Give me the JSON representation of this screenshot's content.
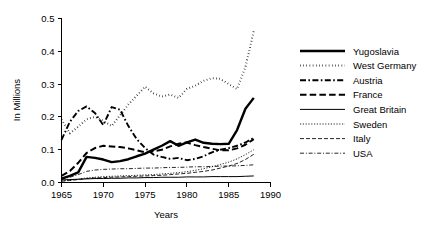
{
  "chart_data": {
    "type": "line",
    "title": "",
    "xlabel": "Years",
    "ylabel": "In Millions",
    "xlim": [
      1965,
      1990
    ],
    "ylim": [
      0.0,
      0.5
    ],
    "grid": false,
    "legend_position": "right",
    "xticks": [
      "1965",
      "1970",
      "1975",
      "1980",
      "1985",
      "1990"
    ],
    "xtick_values": [
      1965,
      1970,
      1975,
      1980,
      1985,
      1990
    ],
    "yticks": [
      "0.0",
      "0.1",
      "0.2",
      "0.3",
      "0.4",
      "0.5"
    ],
    "ytick_values": [
      0.0,
      0.1,
      0.2,
      0.3,
      0.4,
      0.5
    ],
    "x": [
      1965,
      1966,
      1967,
      1968,
      1969,
      1970,
      1971,
      1972,
      1973,
      1974,
      1975,
      1976,
      1977,
      1978,
      1979,
      1980,
      1981,
      1982,
      1983,
      1984,
      1985,
      1986,
      1987,
      1988
    ],
    "series": [
      {
        "name": "Yugoslavia",
        "style": "thick-solid",
        "values": [
          0.012,
          0.02,
          0.031,
          0.078,
          0.075,
          0.07,
          0.062,
          0.065,
          0.071,
          0.08,
          0.088,
          0.1,
          0.112,
          0.126,
          0.112,
          0.122,
          0.131,
          0.121,
          0.118,
          0.117,
          0.118,
          0.16,
          0.225,
          0.258
        ]
      },
      {
        "name": "West Germany",
        "style": "dotted",
        "values": [
          0.192,
          0.15,
          0.17,
          0.193,
          0.2,
          0.188,
          0.172,
          0.205,
          0.238,
          0.265,
          0.292,
          0.272,
          0.262,
          0.268,
          0.258,
          0.285,
          0.295,
          0.31,
          0.318,
          0.316,
          0.3,
          0.285,
          0.352,
          0.462
        ]
      },
      {
        "name": "Austria",
        "style": "dash-dot",
        "values": [
          0.13,
          0.185,
          0.218,
          0.232,
          0.212,
          0.175,
          0.23,
          0.222,
          0.172,
          0.132,
          0.105,
          0.085,
          0.078,
          0.072,
          0.075,
          0.068,
          0.072,
          0.08,
          0.092,
          0.1,
          0.105,
          0.112,
          0.122,
          0.136
        ]
      },
      {
        "name": "France",
        "style": "dashed",
        "values": [
          0.02,
          0.035,
          0.06,
          0.09,
          0.105,
          0.112,
          0.11,
          0.108,
          0.104,
          0.098,
          0.092,
          0.095,
          0.1,
          0.11,
          0.118,
          0.122,
          0.114,
          0.108,
          0.103,
          0.098,
          0.098,
          0.104,
          0.115,
          0.132
        ]
      },
      {
        "name": "Great Britain",
        "style": "thin-solid",
        "values": [
          0.008,
          0.009,
          0.01,
          0.011,
          0.012,
          0.012,
          0.013,
          0.013,
          0.014,
          0.014,
          0.015,
          0.015,
          0.016,
          0.016,
          0.016,
          0.017,
          0.017,
          0.017,
          0.018,
          0.018,
          0.018,
          0.018,
          0.019,
          0.02
        ]
      },
      {
        "name": "Sweden",
        "style": "fine-dotted",
        "values": [
          0.005,
          0.007,
          0.01,
          0.014,
          0.016,
          0.018,
          0.019,
          0.02,
          0.021,
          0.022,
          0.023,
          0.024,
          0.026,
          0.028,
          0.03,
          0.033,
          0.037,
          0.042,
          0.048,
          0.055,
          0.062,
          0.072,
          0.085,
          0.1
        ]
      },
      {
        "name": "Italy",
        "style": "fine-dashed",
        "values": [
          0.004,
          0.006,
          0.009,
          0.012,
          0.014,
          0.015,
          0.016,
          0.017,
          0.018,
          0.019,
          0.02,
          0.021,
          0.022,
          0.024,
          0.026,
          0.028,
          0.031,
          0.034,
          0.038,
          0.044,
          0.05,
          0.058,
          0.07,
          0.086
        ]
      },
      {
        "name": "USA",
        "style": "fine-dash-dot",
        "values": [
          0.01,
          0.016,
          0.024,
          0.034,
          0.038,
          0.04,
          0.041,
          0.042,
          0.042,
          0.043,
          0.044,
          0.044,
          0.045,
          0.046,
          0.046,
          0.047,
          0.048,
          0.048,
          0.049,
          0.05,
          0.05,
          0.051,
          0.052,
          0.054
        ]
      }
    ]
  },
  "legend": {
    "entries": [
      {
        "label": "Yugoslavia"
      },
      {
        "label": "West Germany"
      },
      {
        "label": "Austria"
      },
      {
        "label": "France"
      },
      {
        "label": "Great Britain"
      },
      {
        "label": "Sweden"
      },
      {
        "label": "Italy"
      },
      {
        "label": "USA"
      }
    ]
  }
}
